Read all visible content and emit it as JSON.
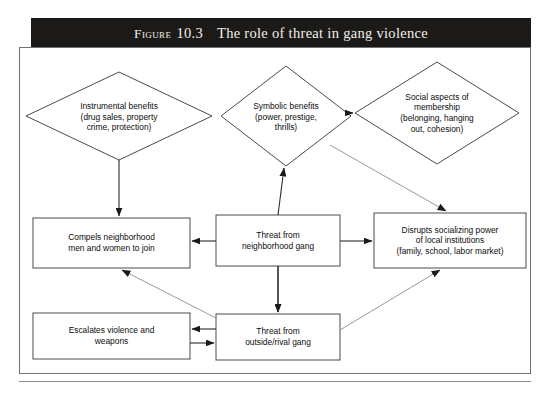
{
  "figure": {
    "title_kicker": "Figure",
    "title_number": "10.3",
    "title_main": "The role of threat in gang violence",
    "source_note": ""
  },
  "colors": {
    "title_bar_bg": "#1c1a18",
    "title_text": "#f2efe9",
    "frame_border": "#6f6f6f",
    "node_stroke": "#4a4a4a",
    "arrow_stroke": "#2a2a2a",
    "page_bg": "#ffffff"
  },
  "nodes": [
    {
      "id": "instrumental-benefits",
      "shape": "diamond",
      "label": "Instrumental benefits\n(drug sales, property\ncrime, protection)"
    },
    {
      "id": "symbolic-benefits",
      "shape": "diamond",
      "label": "Symbolic benefits\n(power, prestige,\nthrills)"
    },
    {
      "id": "social-aspects",
      "shape": "diamond",
      "label": "Social aspects of\nmembership\n(belonging, hanging\nout, cohesion)"
    },
    {
      "id": "compels-join",
      "shape": "rectangle",
      "label": "Compels neighborhood\nmen and women to join"
    },
    {
      "id": "threat-neighborhood-gang",
      "shape": "rectangle",
      "label": "Threat from\nneighborhood gang"
    },
    {
      "id": "disrupts-institutions",
      "shape": "rectangle",
      "label": "Disrupts socializing power\nof local institutions\n(family, school, labor market)"
    },
    {
      "id": "escalates-violence",
      "shape": "rectangle",
      "label": "Escalates violence and\nweapons"
    },
    {
      "id": "threat-outside-rival-gang",
      "shape": "rectangle",
      "label": "Threat from\noutside/rival gang"
    }
  ],
  "edges": [
    {
      "id": "symbolic-to-social",
      "from": "symbolic-benefits",
      "to": "social-aspects",
      "arrow": "single"
    },
    {
      "id": "instrumental-to-compels",
      "from": "instrumental-benefits",
      "to": "compels-join",
      "arrow": "single"
    },
    {
      "id": "threat-neighborhood-to-symbolic",
      "from": "threat-neighborhood-gang",
      "to": "symbolic-benefits",
      "arrow": "single"
    },
    {
      "id": "symbolic-to-disrupts",
      "from": "symbolic-benefits",
      "to": "disrupts-institutions",
      "arrow": "single"
    },
    {
      "id": "threat-neighborhood-to-compels",
      "from": "threat-neighborhood-gang",
      "to": "compels-join",
      "arrow": "single"
    },
    {
      "id": "threat-neighborhood-to-disrupts",
      "from": "threat-neighborhood-gang",
      "to": "disrupts-institutions",
      "arrow": "single"
    },
    {
      "id": "threat-neighborhood-to-threat-outside",
      "from": "threat-neighborhood-gang",
      "to": "threat-outside-rival-gang",
      "arrow": "single"
    },
    {
      "id": "threat-outside-to-compels",
      "from": "threat-outside-rival-gang",
      "to": "compels-join",
      "arrow": "single"
    },
    {
      "id": "threat-outside-to-disrupts",
      "from": "threat-outside-rival-gang",
      "to": "disrupts-institutions",
      "arrow": "single"
    },
    {
      "id": "threat-outside-to-escalates",
      "from": "threat-outside-rival-gang",
      "to": "escalates-violence",
      "arrow": "single"
    },
    {
      "id": "escalates-to-threat-outside",
      "from": "escalates-violence",
      "to": "threat-outside-rival-gang",
      "arrow": "single"
    }
  ]
}
